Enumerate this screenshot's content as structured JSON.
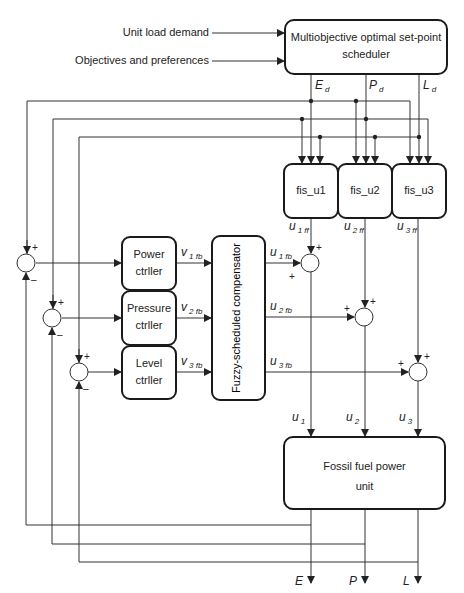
{
  "inputs": {
    "unit_load_demand": "Unit load demand",
    "objectives": "Objectives and preferences"
  },
  "scheduler": {
    "line1": "Multiobjective optimal set-point",
    "line2": "scheduler"
  },
  "setpoints": [
    {
      "main": "E",
      "sub": "d"
    },
    {
      "main": "P",
      "sub": "d"
    },
    {
      "main": "L",
      "sub": "d"
    }
  ],
  "fis": [
    "fis_u1",
    "fis_u2",
    "fis_u3"
  ],
  "feedforward": [
    {
      "main": "u",
      "sub": "1 ff"
    },
    {
      "main": "u",
      "sub": "2 ff"
    },
    {
      "main": "u",
      "sub": "3 ff"
    }
  ],
  "controllers": [
    {
      "line1": "Power",
      "line2": "ctrller"
    },
    {
      "line1": "Pressure",
      "line2": "ctrller"
    },
    {
      "line1": "Level",
      "line2": "ctrller"
    }
  ],
  "controller_outputs": [
    {
      "main": "v",
      "sub": "1 fb"
    },
    {
      "main": "v",
      "sub": "2 fb"
    },
    {
      "main": "v",
      "sub": "3 fb"
    }
  ],
  "compensator": "Fuzzy-scheduled compensator",
  "compensator_outputs": [
    {
      "main": "u",
      "sub": "1 fb"
    },
    {
      "main": "u",
      "sub": "2 fb"
    },
    {
      "main": "u",
      "sub": "3 fb"
    }
  ],
  "plant_inputs": [
    {
      "main": "u",
      "sub": "1"
    },
    {
      "main": "u",
      "sub": "2"
    },
    {
      "main": "u",
      "sub": "3"
    }
  ],
  "plant": {
    "line1": "Fossil fuel power",
    "line2": "unit"
  },
  "outputs": [
    "E",
    "P",
    "L"
  ],
  "signs": {
    "plus": "+",
    "minus": "–"
  },
  "colors": {
    "line": "#333333",
    "box": "#1a1a1a"
  }
}
